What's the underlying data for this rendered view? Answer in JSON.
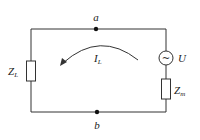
{
  "diagram": {
    "type": "circuit",
    "nodes": [
      {
        "id": "a",
        "label": "a"
      },
      {
        "id": "b",
        "label": "b"
      }
    ],
    "components": [
      {
        "id": "load",
        "kind": "impedance",
        "label_main": "Z",
        "label_sub": "L"
      },
      {
        "id": "source",
        "kind": "ac-voltage-source",
        "label": "U",
        "glyph": "~"
      },
      {
        "id": "internal",
        "kind": "impedance",
        "label_main": "Z",
        "label_sub": "m"
      }
    ],
    "current": {
      "label_main": "I",
      "label_sub": "L",
      "direction": "counterclockwise-arc-left"
    },
    "colors": {
      "wire": "#333333",
      "background": "#ffffff"
    }
  }
}
